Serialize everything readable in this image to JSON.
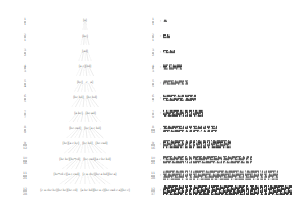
{
  "figure": {
    "background_color": "#ffffff",
    "ink_color": "#4a4a4a",
    "panels": 2
  },
  "left_panel": {
    "name": "derivation-tree",
    "description": "Twelve-level derivation tree of bracketed symbol sequences connected by dashed edges",
    "levels": 12,
    "rows": [
      {
        "index": "1",
        "index_frac": {
          "num": "1",
          "den": "1"
        },
        "nodes": [
          "[a]"
        ]
      },
      {
        "index": "2",
        "index_frac": {
          "num": "2",
          "den": "1"
        },
        "nodes": [
          "[bc]"
        ]
      },
      {
        "index": "3",
        "index_frac": {
          "num": "3",
          "den": "2"
        },
        "nodes": [
          "[ad]"
        ]
      },
      {
        "index": "4",
        "index_frac": {
          "num": "4",
          "den": "3"
        },
        "nodes": [
          "[a c][bd]"
        ]
      },
      {
        "index": "5",
        "index_frac": {
          "num": "5",
          "den": "4"
        },
        "nodes": [
          "[bc]",
          "c",
          "a]"
        ]
      },
      {
        "index": "6",
        "index_frac": {
          "num": "6",
          "den": "5"
        },
        "nodes": [
          "[bc  bd]",
          "[bc  bd]"
        ]
      },
      {
        "index": "7",
        "index_frac": {
          "num": "7",
          "den": "7"
        },
        "nodes": [
          "[a  bc]",
          "[bc  ad]"
        ]
      },
      {
        "index": "8",
        "index_frac": {
          "num": "8",
          "den": "9"
        },
        "nodes": [
          "[bc   cad]",
          "[bc  [a c bd]"
        ]
      },
      {
        "index": "9",
        "index_frac": {
          "num": "9",
          "den": "12"
        },
        "nodes": [
          "[bc][a c bc]",
          "[bc bd]",
          "[bc  cad]"
        ]
      },
      {
        "index": "10",
        "index_frac": {
          "num": "10",
          "den": "16"
        },
        "nodes": [
          "[bc bc][bc*cd]",
          "[bc cad][a c bc bd]"
        ]
      },
      {
        "index": "11",
        "index_frac": {
          "num": "11",
          "den": "21"
        },
        "nodes": [
          "[bc*cd c][a c cad]",
          "[c a cbc][bc a bd][bc a]"
        ]
      },
      {
        "index": "12",
        "index_frac": {
          "num": "12",
          "den": "28"
        },
        "nodes": [
          "[c a cbc bc][bc bc][bc cd]",
          "[a bc bd][bc a c][bc cad c a][bc c]"
        ]
      }
    ]
  },
  "right_panel": {
    "name": "matrix-block-rows",
    "description": "Twelve rows of dense cell grids whose width grows with the row index",
    "rows": [
      {
        "label_frac": {
          "num": "1",
          "den": "1"
        },
        "separator": ":",
        "blocks": [
          {
            "cols": 3,
            "rows": 2
          }
        ]
      },
      {
        "label_frac": {
          "num": "2",
          "den": "1"
        },
        "separator": ":",
        "blocks": [
          {
            "cols": 5,
            "rows": 3
          }
        ]
      },
      {
        "label_frac": {
          "num": "3",
          "den": "2"
        },
        "separator": ":",
        "blocks": [
          {
            "cols": 9,
            "rows": 3
          }
        ]
      },
      {
        "label_frac": {
          "num": "4",
          "den": "3"
        },
        "separator": ":",
        "blocks": [
          {
            "cols": 4,
            "rows": 4
          },
          {
            "cols": 10,
            "rows": 4
          }
        ]
      },
      {
        "label_frac": {
          "num": "5",
          "den": "5"
        },
        "separator": ":",
        "blocks": [
          {
            "cols": 19,
            "rows": 4
          }
        ]
      },
      {
        "label_frac": {
          "num": "6",
          "den": "7"
        },
        "separator": ":",
        "blocks": [
          {
            "cols": 16,
            "rows": 5
          },
          {
            "cols": 8,
            "rows": 5
          }
        ]
      },
      {
        "label_frac": {
          "num": "7",
          "den": "9"
        },
        "separator": ":",
        "blocks": [
          {
            "cols": 30,
            "rows": 5
          }
        ]
      },
      {
        "label_frac": {
          "num": "8",
          "den": "12"
        },
        "separator": ":",
        "blocks": [
          {
            "cols": 28,
            "rows": 5
          },
          {
            "cols": 12,
            "rows": 5
          }
        ]
      },
      {
        "label_frac": {
          "num": "9",
          "den": "16"
        },
        "separator": ":",
        "blocks": [
          {
            "cols": 24,
            "rows": 6
          },
          {
            "cols": 26,
            "rows": 6
          }
        ]
      },
      {
        "label_frac": {
          "num": "10",
          "den": "21"
        },
        "separator": ":",
        "blocks": [
          {
            "cols": 44,
            "rows": 6
          },
          {
            "cols": 22,
            "rows": 6
          }
        ]
      },
      {
        "label_frac": {
          "num": "11",
          "den": "28"
        },
        "separator": ":",
        "blocks": [
          {
            "cols": 40,
            "rows": 7
          },
          {
            "cols": 20,
            "rows": 7
          },
          {
            "cols": 25,
            "rows": 7
          }
        ]
      },
      {
        "label_frac": {
          "num": "12",
          "den": "37"
        },
        "separator": ":",
        "blocks": [
          {
            "cols": 34,
            "rows": 8
          },
          {
            "cols": 30,
            "rows": 8
          },
          {
            "cols": 36,
            "rows": 8
          },
          {
            "cols": 8,
            "rows": 8
          }
        ]
      }
    ]
  }
}
